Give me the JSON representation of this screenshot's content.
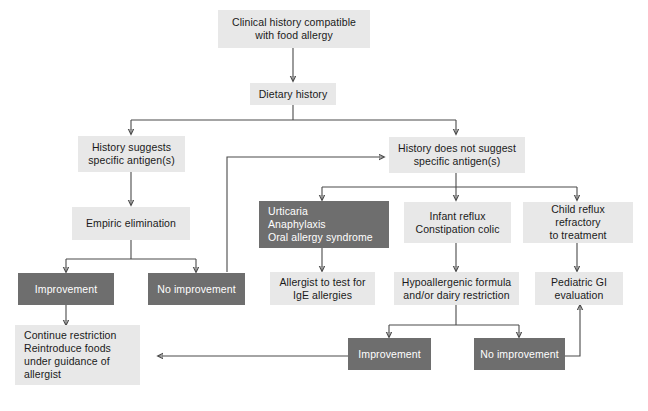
{
  "diagram": {
    "colors": {
      "light_box": "#e8e8e8",
      "dark_box": "#6e6e6e",
      "light_text": "#1a1a1a",
      "dark_text": "#ffffff",
      "connector": "#4a4a4a",
      "background": "#ffffff"
    },
    "nodes": {
      "clinical_history": "Clinical history compatible\nwith food allergy",
      "dietary_history": "Dietary history",
      "history_suggests": "History suggests\nspecific antigen(s)",
      "history_not_suggest": "History does not suggest\nspecific antigen(s)",
      "empiric_elimination": "Empiric elimination",
      "improvement_left": "Improvement",
      "no_improvement_left": "No improvement",
      "urticaria_group": "Urticaria\nAnaphylaxis\nOral allergy syndrome",
      "infant_reflux": "Infant reflux\nConstipation colic",
      "child_reflux": "Child reflux refractory\nto treatment",
      "allergist_test": "Allergist to test for\nIgE allergies",
      "hypoallergenic": "Hypoallergenic formula\nand/or dairy restriction",
      "pediatric_gi": "Pediatric GI\nevaluation",
      "improvement_right": "Improvement",
      "no_improvement_right": "No improvement",
      "continue_restriction": "Continue restriction\nReintroduce foods\n  under guidance of\nallergist"
    }
  }
}
